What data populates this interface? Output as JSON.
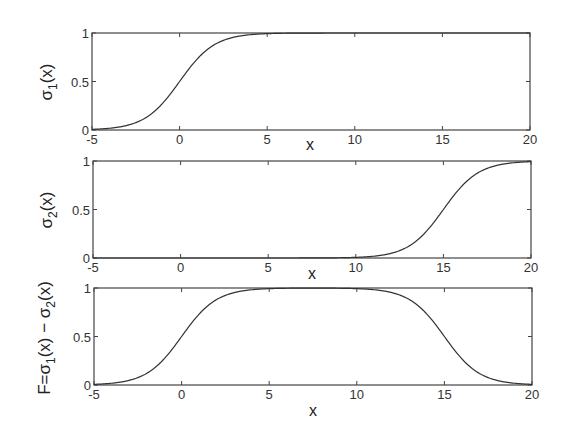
{
  "chart_data": [
    {
      "type": "line",
      "title": "",
      "xlabel": "x",
      "ylabel": "σ1(x)",
      "ylabel_main": "σ",
      "ylabel_sub": "1",
      "ylabel_tail": "(x)",
      "xlim": [
        -5,
        20
      ],
      "ylim": [
        0,
        1
      ],
      "xticks": [
        -5,
        0,
        5,
        10,
        15,
        20
      ],
      "yticks": [
        0,
        0.5,
        1
      ],
      "ytick_labels": [
        "0",
        "0.5",
        "1"
      ],
      "grid": false,
      "series": [
        {
          "name": "σ1(x)",
          "formula": "1/(1+exp(-x))",
          "values_source": "generated from a fitted logistic model, not read pointwise from the image",
          "x": [
            -5,
            -4,
            -3,
            -2,
            -1,
            0,
            1,
            2,
            3,
            4,
            5,
            10,
            15,
            20
          ],
          "values": [
            0.007,
            0.018,
            0.047,
            0.119,
            0.269,
            0.5,
            0.731,
            0.881,
            0.953,
            0.982,
            0.993,
            1.0,
            1.0,
            1.0
          ]
        }
      ]
    },
    {
      "type": "line",
      "title": "",
      "xlabel": "x",
      "ylabel": "σ2(x)",
      "ylabel_main": "σ",
      "ylabel_sub": "2",
      "ylabel_tail": "(x)",
      "xlim": [
        -5,
        20
      ],
      "ylim": [
        0,
        1
      ],
      "xticks": [
        -5,
        0,
        5,
        10,
        15,
        20
      ],
      "yticks": [
        0,
        0.5,
        1
      ],
      "ytick_labels": [
        "0",
        "0.5",
        "1"
      ],
      "grid": false,
      "series": [
        {
          "name": "σ2(x)",
          "formula": "1/(1+exp(-(x-15)))",
          "values_source": "generated from an assumed logistic model centered at x=15 (midpoint observed; steepness assumed equal to σ1, not separately checked)",
          "x": [
            -5,
            0,
            5,
            10,
            11,
            12,
            13,
            14,
            15,
            16,
            17,
            18,
            19,
            20
          ],
          "values": [
            0.0,
            0.0,
            0.0,
            0.007,
            0.018,
            0.047,
            0.119,
            0.269,
            0.5,
            0.731,
            0.881,
            0.953,
            0.982,
            0.993
          ]
        }
      ]
    },
    {
      "type": "line",
      "title": "",
      "xlabel": "x",
      "ylabel": "F=σ1(x) − σ2(x)",
      "ylabel_parts": [
        "F=σ",
        "1",
        "(x) − σ",
        "2",
        "(x)"
      ],
      "xlim": [
        -5,
        20
      ],
      "ylim": [
        0,
        1
      ],
      "xticks": [
        -5,
        0,
        5,
        10,
        15,
        20
      ],
      "yticks": [
        0,
        0.5,
        1
      ],
      "ytick_labels": [
        "0",
        "0.5",
        "1"
      ],
      "grid": false,
      "series": [
        {
          "name": "F(x)",
          "formula": "σ1(x) − σ2(x)",
          "values_source": "computed from the two model formulas above, not read pointwise from the image",
          "x": [
            -5,
            -4,
            -3,
            -2,
            -1,
            0,
            1,
            2,
            3,
            5,
            7.5,
            10,
            12,
            13,
            14,
            15,
            16,
            17,
            18,
            19,
            20
          ],
          "values": [
            0.007,
            0.018,
            0.047,
            0.119,
            0.269,
            0.5,
            0.731,
            0.881,
            0.953,
            0.993,
            0.999,
            0.993,
            0.953,
            0.881,
            0.731,
            0.5,
            0.269,
            0.119,
            0.047,
            0.018,
            0.007
          ]
        }
      ]
    }
  ],
  "panels": [
    {
      "x_axis_label": "x",
      "y_axis_label_main": "σ",
      "y_axis_label_sub": "1",
      "y_axis_label_tail": "(x)"
    },
    {
      "x_axis_label": "x",
      "y_axis_label_main": "σ",
      "y_axis_label_sub": "2",
      "y_axis_label_tail": "(x)"
    },
    {
      "x_axis_label": "x",
      "y_axis_label_parts": [
        "F=σ",
        "1",
        "(x) − σ",
        "2",
        "(x)"
      ]
    }
  ],
  "style": {
    "line_color": "#333333",
    "frame_color": "#444444",
    "background": "#ffffff"
  }
}
